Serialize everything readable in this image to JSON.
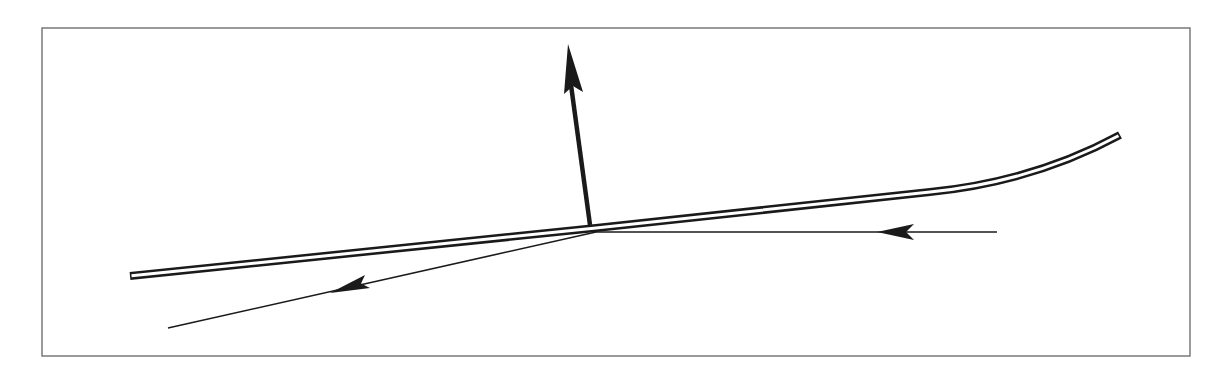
{
  "diagram": {
    "type": "reflection-diagram",
    "frame": {
      "x": 42,
      "y": 28,
      "width": 1148,
      "height": 328,
      "stroke": "#7a7a7a"
    },
    "colors": {
      "ink": "#1a1a1a",
      "background": "#ffffff"
    },
    "elements": [
      {
        "id": "reflecting-surface",
        "kind": "double-line-curve",
        "description": "thin slab / surface, straight then curving upward at right end"
      },
      {
        "id": "normal-vector",
        "kind": "thick-arrow",
        "from": [
          590,
          224
        ],
        "to": [
          568,
          44
        ],
        "direction": "up"
      },
      {
        "id": "incident-ray",
        "kind": "thin-arrow",
        "from": [
          997,
          232
        ],
        "to": [
          596,
          232
        ],
        "direction": "left"
      },
      {
        "id": "reflected-ray",
        "kind": "thin-arrow",
        "from": [
          596,
          232
        ],
        "to": [
          168,
          328
        ],
        "direction": "down-left"
      }
    ],
    "labels": []
  }
}
